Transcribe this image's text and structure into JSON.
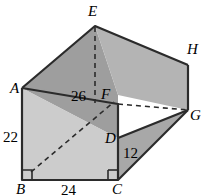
{
  "figure": {
    "canvas": {
      "width": 204,
      "height": 196,
      "background": "#ffffff"
    },
    "colors": {
      "top_left_face": "#9e9e9e",
      "top_right_face": "#b4b4b4",
      "front_face": "#cccccc",
      "right_face": "#a8a8a8",
      "outline": "#2b2b2b",
      "dashed": "#2b2b2b",
      "text": "#000000"
    },
    "vertices": [
      {
        "name": "A",
        "label": "A",
        "x": 22,
        "y": 88,
        "label_x": 10,
        "label_y": 83
      },
      {
        "name": "B",
        "label": "B",
        "x": 22,
        "y": 180,
        "label_x": 16,
        "label_y": 185
      },
      {
        "name": "C",
        "label": "C",
        "x": 118,
        "y": 180,
        "label_x": 112,
        "label_y": 185
      },
      {
        "name": "D",
        "label": "D",
        "x": 118,
        "y": 138,
        "label_x": 106,
        "label_y": 135
      },
      {
        "name": "E",
        "label": "E",
        "x": 95,
        "y": 26,
        "label_x": 88,
        "label_y": 6
      },
      {
        "name": "F",
        "label": "F",
        "x": 118,
        "y": 95,
        "label_x": 100,
        "label_y": 90
      },
      {
        "name": "G",
        "label": "G",
        "x": 188,
        "y": 110,
        "label_x": 191,
        "label_y": 109
      },
      {
        "name": "H",
        "label": "H",
        "x": 188,
        "y": 65,
        "label_x": 188,
        "label_y": 44
      }
    ],
    "dimensions": [
      {
        "name": "left-height",
        "value": "22",
        "x": 4,
        "y": 133,
        "measures": "A to B"
      },
      {
        "name": "bottom-width",
        "value": "24",
        "x": 62,
        "y": 183,
        "measures": "B to C"
      },
      {
        "name": "diagonal",
        "value": "26",
        "x": 72,
        "y": 92,
        "measures": "B to F"
      },
      {
        "name": "right-height",
        "value": "12",
        "x": 124,
        "y": 150,
        "measures": "D to C"
      }
    ],
    "solid_edges": [
      "A-B",
      "B-C",
      "C-D",
      "D-F",
      "A-E",
      "E-H",
      "A-F",
      "D-G",
      "G-H",
      "C-G",
      "H-E"
    ],
    "dashed_edges": [
      {
        "name": "E-F-vertical",
        "from": "E",
        "to": "F"
      },
      {
        "name": "F-G-horizontal",
        "from": "F",
        "to": "G"
      },
      {
        "name": "B-F-diagonal",
        "from": "B",
        "to": "F"
      }
    ],
    "right_angle_markers": [
      {
        "name": "right-angle-at-B",
        "at": "B"
      },
      {
        "name": "right-angle-at-C",
        "at": "C"
      }
    ]
  }
}
